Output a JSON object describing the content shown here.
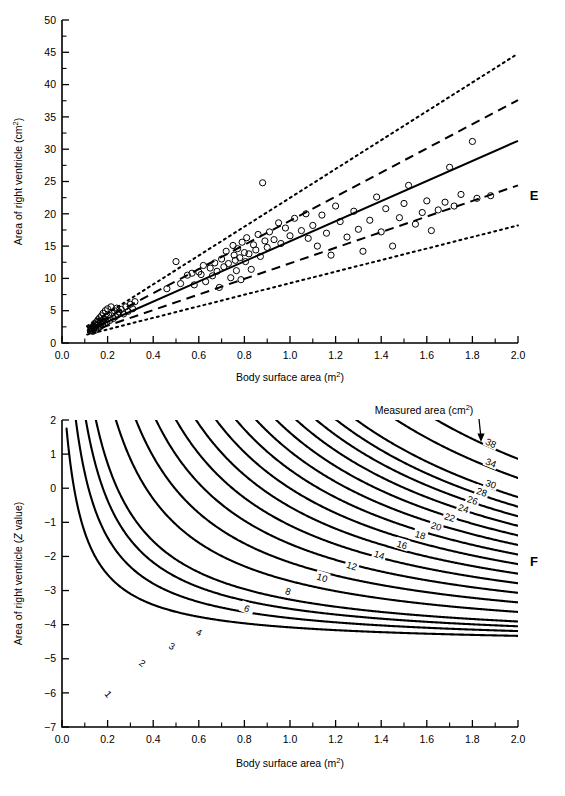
{
  "figure": {
    "background": "#ffffff",
    "line_color": "#000000"
  },
  "panelE": {
    "letter": "E",
    "xlabel": "Body surface area (m",
    "xlabel_sup": "2",
    "xlabel_tail": ")",
    "ylabel": "Area of right ventricle (cm",
    "ylabel_sup": "2",
    "ylabel_tail": ")",
    "xticks": [
      "0.0",
      "0.2",
      "0.4",
      "0.6",
      "0.8",
      "1.0",
      "1.2",
      "1.4",
      "1.6",
      "1.8",
      "2.0"
    ],
    "yticks": [
      "0",
      "5",
      "10",
      "15",
      "20",
      "25",
      "30",
      "35",
      "40",
      "45",
      "50"
    ]
  },
  "panelF": {
    "letter": "F",
    "xlabel": "Body surface area (m",
    "xlabel_sup": "2",
    "xlabel_tail": ")",
    "ylabel_a": "Area of right ventricle (",
    "ylabel_z": "Z",
    "ylabel_b": " value)",
    "annotation": "Measured area (cm",
    "annotation_sup": "2",
    "annotation_tail": ")",
    "xticks": [
      "0.0",
      "0.2",
      "0.4",
      "0.6",
      "0.8",
      "1.0",
      "1.2",
      "1.4",
      "1.6",
      "1.8",
      "2.0"
    ],
    "yticks": [
      "2",
      "1",
      "0",
      "−1",
      "−2",
      "−3",
      "−4",
      "−5",
      "−6",
      "−7"
    ]
  },
  "chart_data": [
    {
      "type": "scatter",
      "title": "Area of right ventricle vs body surface area",
      "panel": "E",
      "xlabel": "Body surface area (m2)",
      "ylabel": "Area of right ventricle (cm2)",
      "xlim": [
        0.0,
        2.0
      ],
      "ylim": [
        0,
        50
      ],
      "xticks": [
        0.0,
        0.2,
        0.4,
        0.6,
        0.8,
        1.0,
        1.2,
        1.4,
        1.6,
        1.8,
        2.0
      ],
      "yticks": [
        0,
        5,
        10,
        15,
        20,
        25,
        30,
        35,
        40,
        45,
        50
      ],
      "grid": false,
      "legend": "none",
      "series": [
        {
          "name": "observations",
          "marker": "open-circle",
          "points": [
            [
              0.125,
              1.9
            ],
            [
              0.13,
              2.1
            ],
            [
              0.132,
              2.4
            ],
            [
              0.135,
              1.8
            ],
            [
              0.138,
              2.6
            ],
            [
              0.14,
              2.2
            ],
            [
              0.142,
              3.0
            ],
            [
              0.145,
              2.5
            ],
            [
              0.148,
              2.0
            ],
            [
              0.15,
              2.8
            ],
            [
              0.152,
              3.3
            ],
            [
              0.155,
              2.3
            ],
            [
              0.158,
              3.6
            ],
            [
              0.16,
              2.9
            ],
            [
              0.163,
              2.4
            ],
            [
              0.165,
              3.9
            ],
            [
              0.168,
              3.1
            ],
            [
              0.17,
              2.6
            ],
            [
              0.173,
              4.2
            ],
            [
              0.175,
              3.4
            ],
            [
              0.178,
              2.8
            ],
            [
              0.18,
              4.6
            ],
            [
              0.183,
              3.7
            ],
            [
              0.186,
              3.0
            ],
            [
              0.19,
              5.0
            ],
            [
              0.193,
              4.0
            ],
            [
              0.196,
              3.2
            ],
            [
              0.2,
              5.3
            ],
            [
              0.205,
              4.3
            ],
            [
              0.21,
              3.5
            ],
            [
              0.215,
              5.6
            ],
            [
              0.22,
              4.6
            ],
            [
              0.225,
              3.8
            ],
            [
              0.23,
              5.0
            ],
            [
              0.235,
              4.1
            ],
            [
              0.24,
              5.4
            ],
            [
              0.245,
              4.4
            ],
            [
              0.25,
              4.8
            ],
            [
              0.26,
              5.2
            ],
            [
              0.27,
              4.5
            ],
            [
              0.28,
              5.6
            ],
            [
              0.29,
              4.9
            ],
            [
              0.3,
              6.0
            ],
            [
              0.31,
              5.3
            ],
            [
              0.32,
              6.4
            ],
            [
              0.46,
              8.4
            ],
            [
              0.5,
              12.6
            ],
            [
              0.52,
              9.2
            ],
            [
              0.55,
              10.5
            ],
            [
              0.57,
              10.8
            ],
            [
              0.58,
              9.0
            ],
            [
              0.6,
              11.0
            ],
            [
              0.61,
              10.6
            ],
            [
              0.62,
              12.0
            ],
            [
              0.63,
              9.5
            ],
            [
              0.65,
              11.6
            ],
            [
              0.66,
              10.4
            ],
            [
              0.67,
              12.4
            ],
            [
              0.68,
              11.1
            ],
            [
              0.69,
              8.6
            ],
            [
              0.7,
              13.0
            ],
            [
              0.71,
              11.8
            ],
            [
              0.72,
              14.2
            ],
            [
              0.73,
              12.3
            ],
            [
              0.74,
              10.1
            ],
            [
              0.75,
              15.1
            ],
            [
              0.755,
              13.6
            ],
            [
              0.76,
              12.8
            ],
            [
              0.765,
              11.2
            ],
            [
              0.77,
              14.6
            ],
            [
              0.78,
              13.2
            ],
            [
              0.785,
              9.8
            ],
            [
              0.79,
              15.6
            ],
            [
              0.8,
              14.0
            ],
            [
              0.805,
              12.6
            ],
            [
              0.81,
              16.3
            ],
            [
              0.82,
              13.8
            ],
            [
              0.83,
              11.4
            ],
            [
              0.84,
              15.2
            ],
            [
              0.85,
              14.4
            ],
            [
              0.86,
              16.8
            ],
            [
              0.87,
              13.4
            ],
            [
              0.88,
              24.8
            ],
            [
              0.89,
              15.8
            ],
            [
              0.9,
              14.8
            ],
            [
              0.91,
              17.2
            ],
            [
              0.93,
              16.0
            ],
            [
              0.95,
              18.6
            ],
            [
              0.96,
              15.4
            ],
            [
              0.98,
              17.8
            ],
            [
              1.0,
              16.6
            ],
            [
              1.02,
              19.3
            ],
            [
              1.05,
              17.4
            ],
            [
              1.07,
              20.0
            ],
            [
              1.08,
              16.2
            ],
            [
              1.1,
              18.2
            ],
            [
              1.12,
              15.0
            ],
            [
              1.14,
              19.8
            ],
            [
              1.16,
              17.0
            ],
            [
              1.18,
              13.6
            ],
            [
              1.2,
              21.2
            ],
            [
              1.22,
              18.8
            ],
            [
              1.25,
              16.4
            ],
            [
              1.28,
              20.4
            ],
            [
              1.3,
              17.6
            ],
            [
              1.32,
              14.2
            ],
            [
              1.35,
              19.0
            ],
            [
              1.38,
              22.6
            ],
            [
              1.4,
              17.2
            ],
            [
              1.42,
              20.8
            ],
            [
              1.45,
              15.0
            ],
            [
              1.48,
              19.4
            ],
            [
              1.5,
              21.6
            ],
            [
              1.52,
              24.4
            ],
            [
              1.55,
              18.4
            ],
            [
              1.58,
              20.2
            ],
            [
              1.6,
              22.0
            ],
            [
              1.62,
              17.4
            ],
            [
              1.65,
              20.6
            ],
            [
              1.68,
              21.8
            ],
            [
              1.7,
              27.2
            ],
            [
              1.72,
              21.2
            ],
            [
              1.75,
              23.0
            ],
            [
              1.8,
              31.2
            ],
            [
              1.82,
              22.4
            ],
            [
              1.88,
              22.8
            ]
          ]
        }
      ],
      "reference_lines": [
        {
          "name": "upper-outer",
          "style": "dotted",
          "x": [
            0.11,
            2.0
          ],
          "y": [
            2.6,
            44.8
          ]
        },
        {
          "name": "upper-inner",
          "style": "dashed",
          "x": [
            0.11,
            2.0
          ],
          "y": [
            2.3,
            37.6
          ]
        },
        {
          "name": "mean",
          "style": "solid",
          "x": [
            0.11,
            2.0
          ],
          "y": [
            1.9,
            31.3
          ]
        },
        {
          "name": "lower-inner",
          "style": "dashed",
          "x": [
            0.11,
            2.0
          ],
          "y": [
            1.6,
            24.4
          ]
        },
        {
          "name": "lower-outer",
          "style": "dotted",
          "x": [
            0.11,
            2.0
          ],
          "y": [
            1.3,
            18.2
          ]
        }
      ]
    },
    {
      "type": "line",
      "title": "Z value contours for measured right ventricle area",
      "panel": "F",
      "xlabel": "Body surface area (m2)",
      "ylabel": "Area of right ventricle (Z value)",
      "xlim": [
        0.0,
        2.0
      ],
      "ylim": [
        -7,
        2
      ],
      "xticks": [
        0.0,
        0.2,
        0.4,
        0.6,
        0.8,
        1.0,
        1.2,
        1.4,
        1.6,
        1.8,
        2.0
      ],
      "yticks": [
        2,
        1,
        0,
        -1,
        -2,
        -3,
        -4,
        -5,
        -6,
        -7
      ],
      "grid": false,
      "legend": "none",
      "annotation": "Measured area (cm2)",
      "contour_levels": [
        1,
        2,
        3,
        4,
        6,
        8,
        10,
        12,
        14,
        16,
        18,
        20,
        22,
        24,
        26,
        28,
        30,
        34,
        38
      ],
      "contour_label_positions": [
        {
          "level": 1,
          "x": 0.2,
          "y": -6.05
        },
        {
          "level": 2,
          "x": 0.35,
          "y": -5.15
        },
        {
          "level": 3,
          "x": 0.48,
          "y": -4.65
        },
        {
          "level": 4,
          "x": 0.6,
          "y": -4.25
        },
        {
          "level": 6,
          "x": 0.81,
          "y": -3.55
        },
        {
          "level": 8,
          "x": 0.99,
          "y": -3.05
        },
        {
          "level": 10,
          "x": 1.14,
          "y": -2.65
        },
        {
          "level": 12,
          "x": 1.27,
          "y": -2.3
        },
        {
          "level": 14,
          "x": 1.39,
          "y": -1.98
        },
        {
          "level": 16,
          "x": 1.49,
          "y": -1.68
        },
        {
          "level": 18,
          "x": 1.57,
          "y": -1.4
        },
        {
          "level": 20,
          "x": 1.64,
          "y": -1.14
        },
        {
          "level": 22,
          "x": 1.7,
          "y": -0.88
        },
        {
          "level": 24,
          "x": 1.76,
          "y": -0.62
        },
        {
          "level": 26,
          "x": 1.8,
          "y": -0.38
        },
        {
          "level": 28,
          "x": 1.84,
          "y": -0.14
        },
        {
          "level": 30,
          "x": 1.88,
          "y": 0.1
        },
        {
          "level": 34,
          "x": 1.88,
          "y": 0.72
        },
        {
          "level": 38,
          "x": 1.88,
          "y": 1.3
        }
      ]
    }
  ]
}
